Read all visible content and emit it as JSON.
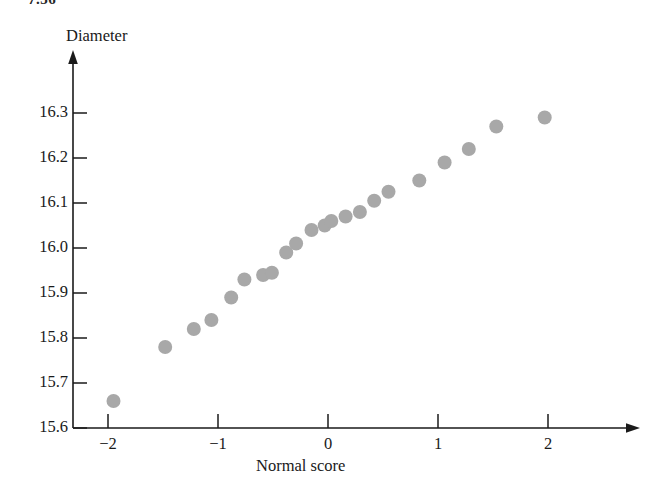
{
  "page": {
    "corner_label": "7.36",
    "background_color": "#ffffff"
  },
  "chart_data": {
    "type": "scatter",
    "title": "",
    "subtitle": "",
    "xlabel": "Normal score",
    "ylabel": "Diameter",
    "xlim": [
      -2.35,
      2.6
    ],
    "ylim": [
      15.6,
      16.36
    ],
    "grid": false,
    "legend_position": "none",
    "marker_color": "#a8a8a8",
    "axis_color": "#1a1a1a",
    "xticks": [
      -2,
      -1,
      0,
      1,
      2
    ],
    "xtick_labels": [
      "−2",
      "−1",
      "0",
      "1",
      "2"
    ],
    "yticks": [
      15.6,
      15.7,
      15.8,
      15.9,
      16.0,
      16.1,
      16.2,
      16.3
    ],
    "ytick_labels": [
      "15.6",
      "15.7",
      "15.8",
      "15.9",
      "16.0",
      "16.1",
      "16.2",
      "16.3"
    ],
    "x": [
      -1.95,
      -1.48,
      -1.22,
      -1.06,
      -0.88,
      -0.76,
      -0.59,
      -0.51,
      -0.38,
      -0.29,
      -0.15,
      -0.03,
      0.03,
      0.16,
      0.29,
      0.42,
      0.55,
      0.83,
      1.06,
      1.28,
      1.53,
      1.97
    ],
    "y": [
      15.66,
      15.78,
      15.82,
      15.84,
      15.89,
      15.93,
      15.94,
      15.945,
      15.99,
      16.01,
      16.04,
      16.05,
      16.06,
      16.07,
      16.08,
      16.105,
      16.125,
      16.15,
      16.19,
      16.22,
      16.27,
      16.29
    ],
    "points": [
      {
        "normal_score": -1.95,
        "diameter": 15.66
      },
      {
        "normal_score": -1.48,
        "diameter": 15.78
      },
      {
        "normal_score": -1.22,
        "diameter": 15.82
      },
      {
        "normal_score": -1.06,
        "diameter": 15.84
      },
      {
        "normal_score": -0.88,
        "diameter": 15.89
      },
      {
        "normal_score": -0.76,
        "diameter": 15.93
      },
      {
        "normal_score": -0.59,
        "diameter": 15.94
      },
      {
        "normal_score": -0.51,
        "diameter": 15.945
      },
      {
        "normal_score": -0.38,
        "diameter": 15.99
      },
      {
        "normal_score": -0.29,
        "diameter": 16.01
      },
      {
        "normal_score": -0.15,
        "diameter": 16.04
      },
      {
        "normal_score": -0.03,
        "diameter": 16.05
      },
      {
        "normal_score": 0.03,
        "diameter": 16.06
      },
      {
        "normal_score": 0.16,
        "diameter": 16.07
      },
      {
        "normal_score": 0.29,
        "diameter": 16.08
      },
      {
        "normal_score": 0.42,
        "diameter": 16.105
      },
      {
        "normal_score": 0.55,
        "diameter": 16.125
      },
      {
        "normal_score": 0.83,
        "diameter": 16.15
      },
      {
        "normal_score": 1.06,
        "diameter": 16.19
      },
      {
        "normal_score": 1.28,
        "diameter": 16.22
      },
      {
        "normal_score": 1.53,
        "diameter": 16.27
      },
      {
        "normal_score": 1.97,
        "diameter": 16.29
      }
    ],
    "n_points": 22
  }
}
